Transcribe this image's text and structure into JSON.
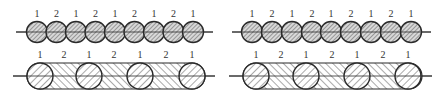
{
  "diagram": {
    "colors": {
      "stroke": "#2a2a2a",
      "fill": "#d8d8d8",
      "hatch": "#555555",
      "background": "#ffffff"
    },
    "panels": [
      {
        "id": "top-left",
        "type": "circle-chain",
        "axis": {
          "x1": 16,
          "x2": 213,
          "y": 32
        },
        "circle_radius": 10.5,
        "circles_cx": [
          37,
          56.5,
          76,
          95.5,
          115,
          134.5,
          154,
          173.5,
          193
        ],
        "label_y": 17,
        "labels": [
          "1",
          "2",
          "1",
          "2",
          "1",
          "2",
          "1",
          "2",
          "1"
        ]
      },
      {
        "id": "top-right",
        "type": "circle-chain",
        "axis": {
          "x1": 232,
          "x2": 431,
          "y": 32
        },
        "circle_radius": 10.5,
        "circles_cx": [
          252,
          272,
          292,
          312,
          331,
          351,
          371,
          391,
          411
        ],
        "label_y": 17,
        "labels": [
          "1",
          "2",
          "1",
          "2",
          "1",
          "2",
          "1",
          "2",
          "1"
        ]
      },
      {
        "id": "bottom-left",
        "type": "bar-with-circles",
        "axis": {
          "x1": 13,
          "x2": 215,
          "y": 76
        },
        "bar": {
          "x1": 27,
          "x2": 205,
          "y1": 63,
          "y2": 89
        },
        "circle_radius": 13,
        "circles_cx": [
          40,
          89,
          140,
          192
        ],
        "label_y": 58,
        "labels": [
          "1",
          "2",
          "1",
          "2",
          "1",
          "2",
          "1"
        ],
        "labels_x": [
          40,
          64,
          89,
          114,
          140,
          166,
          192
        ]
      },
      {
        "id": "bottom-right",
        "type": "bar-with-circles",
        "axis": {
          "x1": 229,
          "x2": 432,
          "y": 76
        },
        "bar": {
          "x1": 243,
          "x2": 422,
          "y1": 63,
          "y2": 89
        },
        "circle_radius": 13,
        "circles_cx": [
          256,
          306,
          357,
          408
        ],
        "label_y": 58,
        "labels": [
          "1",
          "2",
          "1",
          "2",
          "1",
          "2",
          "1"
        ],
        "labels_x": [
          256,
          281,
          306,
          332,
          357,
          383,
          408
        ]
      }
    ]
  }
}
